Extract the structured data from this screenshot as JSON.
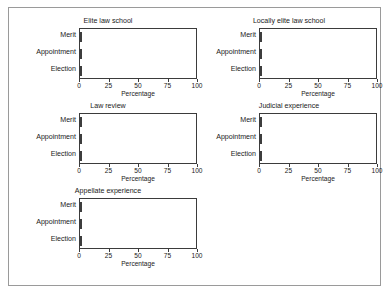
{
  "chart_data": {
    "type": "bar",
    "orientation": "horizontal",
    "title": "",
    "xlabel": "Percentage",
    "ylabel": "",
    "xlim": [
      0,
      100
    ],
    "xticks": [
      0,
      25,
      50,
      75,
      100
    ],
    "xticklabels": [
      "0",
      "25",
      "50",
      "75",
      "100"
    ],
    "grid": false,
    "legend": null,
    "categories": [
      "Merit",
      "Appointment",
      "Election"
    ],
    "panels": [
      {
        "title": "Elite law school",
        "categories": [
          "Merit",
          "Appointment",
          "Election"
        ],
        "values": [
          23,
          28,
          11
        ]
      },
      {
        "title": "Locally elite law school",
        "categories": [
          "Merit",
          "Appointment",
          "Election"
        ],
        "values": [
          63,
          62,
          58
        ]
      },
      {
        "title": "Law review",
        "categories": [
          "Merit",
          "Appointment",
          "Election"
        ],
        "values": [
          30,
          24,
          19
        ]
      },
      {
        "title": "Judicial experience",
        "categories": [
          "Merit",
          "Appointment",
          "Election"
        ],
        "values": [
          67,
          69,
          68
        ]
      },
      {
        "title": "Appellate experience",
        "categories": [
          "Merit",
          "Appointment",
          "Election"
        ],
        "values": [
          27,
          28,
          28
        ]
      }
    ],
    "colors": {
      "bar_fill": "#575757",
      "bar_edge": "#3d3d3d",
      "axis": "#3b3b3b",
      "text": "#1a1a1a",
      "figure_border": "#9a9a9a",
      "background": "#ffffff"
    }
  }
}
